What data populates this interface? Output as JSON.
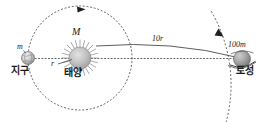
{
  "figure": {
    "background_color": "#ffffff",
    "stroke_color": "#3c3c3c",
    "text_color": "#1a1a1a"
  },
  "bodies": {
    "sun": {
      "name_label": "태양",
      "mass_label": "M",
      "icon": "sun-icon",
      "cx": 80,
      "cy": 58,
      "r": 11,
      "fill": "#b8b8b8"
    },
    "earth": {
      "name_label": "지구",
      "mass_label": "m",
      "icon": "earth-icon",
      "cx": 28,
      "cy": 58,
      "r": 6.5,
      "fill": "#c9c9c9"
    },
    "saturn": {
      "name_label": "토성",
      "mass_label": "100m",
      "icon": "saturn-icon",
      "cx": 242,
      "cy": 59,
      "r": 8.5,
      "fill": "#9a9a9a"
    }
  },
  "measurements": {
    "earth_radius_label": "r",
    "saturn_distance_label": "10r"
  },
  "orbits": {
    "earth_orbit": {
      "name": "earth-orbit-path",
      "style": "dotted",
      "radius": 52,
      "arrow": "counterclockwise-arrowhead"
    },
    "saturn_orbit": {
      "name": "saturn-orbit-path",
      "style": "dotted",
      "radius": 146,
      "arrow": "counterclockwise-arrowhead"
    },
    "axis_line": {
      "name": "horizontal-axis-line",
      "style": "dotted"
    },
    "distance_arc": {
      "name": "distance-arc-line",
      "style": "solid"
    }
  }
}
